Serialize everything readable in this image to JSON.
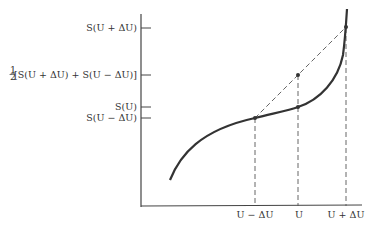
{
  "diagram": {
    "type": "function-curve-with-chord",
    "y_tick_labels": [
      {
        "id": "s-u-plus",
        "text": "S(U + ΔU)"
      },
      {
        "id": "s-avg",
        "frac": "1/2",
        "text": "[S(U + ΔU) + S(U − ΔU)]"
      },
      {
        "id": "s-u",
        "text": "S(U)"
      },
      {
        "id": "s-u-minus",
        "text": "S(U − ΔU)"
      }
    ],
    "x_tick_labels": [
      {
        "id": "u-minus",
        "text": "U − ΔU"
      },
      {
        "id": "u",
        "text": "U"
      },
      {
        "id": "u-plus",
        "text": "U + ΔU"
      }
    ],
    "points": [
      {
        "name": "S(U-ΔU)",
        "x": "U-ΔU"
      },
      {
        "name": "S(U)",
        "x": "U"
      },
      {
        "name": "average",
        "x": "U"
      },
      {
        "name": "S(U+ΔU)",
        "x": "U+ΔU"
      }
    ],
    "colors": {
      "ink": "#333333",
      "dash": "#555555"
    }
  }
}
